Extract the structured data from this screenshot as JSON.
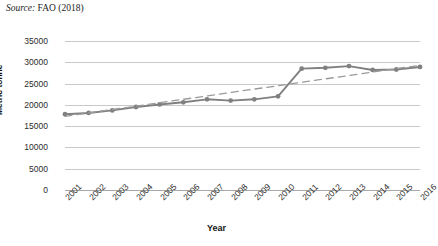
{
  "caption": {
    "label": "Source:",
    "text": " FAO (2018)"
  },
  "chart_data": {
    "type": "line",
    "title": "",
    "xlabel": "Year",
    "ylabel": "Metric tonne",
    "categories": [
      "2001",
      "2002",
      "2003",
      "2004",
      "2005",
      "2006",
      "2007",
      "2008",
      "2009",
      "2010",
      "2011",
      "2012",
      "2013",
      "2014",
      "2015",
      "2016"
    ],
    "series": [
      {
        "name": "Production",
        "values": [
          17800,
          18100,
          18700,
          19500,
          20100,
          20600,
          21300,
          21000,
          21300,
          22000,
          28500,
          28700,
          29100,
          28200,
          28300,
          28900
        ],
        "color": "#808080",
        "marker": "circle",
        "style": "solid"
      },
      {
        "name": "Linear trendline",
        "values": [
          17300,
          18100,
          18900,
          19700,
          20500,
          21300,
          22100,
          22900,
          23700,
          24500,
          25300,
          26100,
          26900,
          27700,
          28500,
          29300
        ],
        "color": "#9a9a9a",
        "marker": "none",
        "style": "dashed"
      }
    ],
    "yticks": [
      0,
      5000,
      10000,
      15000,
      20000,
      25000,
      30000,
      35000
    ],
    "ytick_labels": [
      "0",
      "5000",
      "10000",
      "15000",
      "20000",
      "25000",
      "30000",
      "35000"
    ],
    "ylim": [
      0,
      35000
    ],
    "grid": true,
    "legend": "none",
    "colors": {
      "line": "#808080",
      "trendline": "#9a9a9a",
      "gridline": "#c9c9c9",
      "text": "#2b2b2b"
    }
  }
}
